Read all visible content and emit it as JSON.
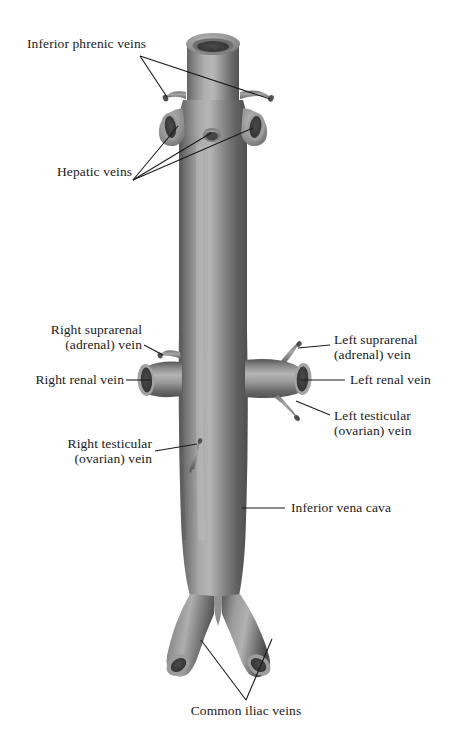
{
  "figure": {
    "vessel_color_dark": "#4c4c4c",
    "vessel_color_mid": "#8d8d8d",
    "vessel_color_light": "#bdbdbd",
    "lumen_color": "#3a3a3a",
    "leader_color": "#1a1a1a",
    "background": "#ffffff"
  },
  "labels": {
    "inferior_phrenic": "Inferior phrenic veins",
    "hepatic": "Hepatic veins",
    "right_suprarenal_l1": "Right suprarenal",
    "right_suprarenal_l2": "(adrenal) vein",
    "right_renal": "Right renal vein",
    "left_suprarenal_l1": "Left suprarenal",
    "left_suprarenal_l2": "(adrenal) vein",
    "left_renal": "Left renal vein",
    "left_testicular_l1": "Left testicular",
    "left_testicular_l2": "(ovarian) vein",
    "right_testicular_l1": "Right testicular",
    "right_testicular_l2": "(ovarian) vein",
    "inferior_vena_cava": "Inferior vena cava",
    "common_iliac": "Common iliac veins"
  }
}
